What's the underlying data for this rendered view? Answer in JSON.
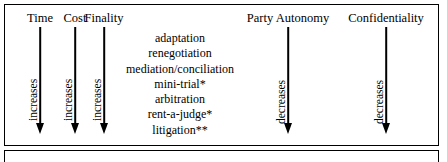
{
  "figure": {
    "columns": [
      {
        "header": "Time",
        "direction": "increases"
      },
      {
        "header": "Cost",
        "direction": "increases"
      },
      {
        "header": "Finality",
        "direction": "increases"
      },
      {
        "header": "Party Autonomy",
        "direction": "decreases"
      },
      {
        "header": "Confidentiality",
        "direction": "decreases"
      }
    ],
    "processes": [
      "adaptation",
      "renegotiation",
      "mediation/conciliation",
      "mini-trial*",
      "arbitration",
      "rent-a-judge*",
      "litigation**"
    ],
    "colors": {
      "ink": "#000000",
      "background": "#ffffff"
    }
  }
}
